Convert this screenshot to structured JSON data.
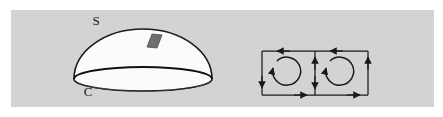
{
  "figure": {
    "background_color": "#ffffff",
    "panel_color": "#d3d3d3",
    "ink_color": "#1a1a1a",
    "surface_fill": "#fbfbfb",
    "patch_fill": "#6e6e6e"
  },
  "left_panel": {
    "name": "oriented-surface-diagram",
    "surface_label": "S",
    "boundary_label": "C",
    "surface_label_pos": {
      "x": 96,
      "y": 25
    },
    "boundary_label_pos": {
      "x": 88,
      "y": 96
    },
    "dome": {
      "center_x": 143,
      "center_y": 79,
      "radius_x": 69,
      "radius_y": 50,
      "base_ellipse_ry": 12
    },
    "patch": {
      "name": "surface-element-patch",
      "points": "147,47 152,34 162,35 157,48"
    },
    "dashed_back_edge": true,
    "solid_front_edge": true
  },
  "right_panel": {
    "name": "circulation-rectangles-diagram",
    "rect_left": {
      "x": 262,
      "y": 51,
      "width": 53,
      "height": 44
    },
    "rect_right": {
      "x": 315,
      "y": 51,
      "width": 53,
      "height": 44
    },
    "edge_arrows": [
      {
        "name": "top-edge-arrow-left-rect",
        "direction": "left"
      },
      {
        "name": "left-edge-arrow-left-rect",
        "direction": "down"
      },
      {
        "name": "bottom-edge-arrow-left-rect",
        "direction": "right"
      },
      {
        "name": "shared-edge-arrow-up",
        "direction": "up"
      },
      {
        "name": "top-edge-arrow-right-rect",
        "direction": "left"
      },
      {
        "name": "shared-edge-arrow-down",
        "direction": "down"
      },
      {
        "name": "bottom-edge-arrow-right-rect",
        "direction": "right"
      },
      {
        "name": "right-edge-arrow-right-rect",
        "direction": "up"
      }
    ],
    "circulation_arrows": [
      {
        "name": "circulation-arrow-left",
        "center_x": 286,
        "center_y": 72,
        "radius": 14,
        "sense": "clockwise"
      },
      {
        "name": "circulation-arrow-right",
        "center_x": 339,
        "center_y": 72,
        "radius": 14,
        "sense": "clockwise"
      }
    ]
  }
}
